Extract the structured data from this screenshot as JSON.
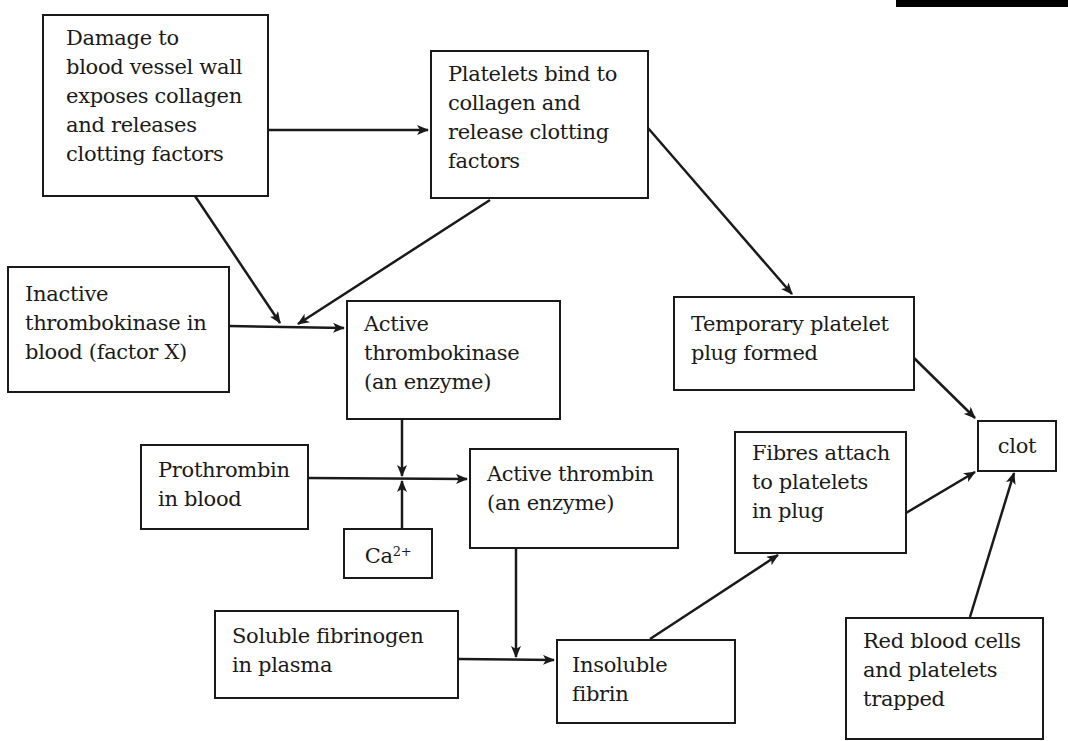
{
  "diagram": {
    "type": "flowchart",
    "topic": "Blood clotting cascade",
    "nodes": {
      "damage": {
        "lines": [
          "Damage to",
          "blood vessel wall",
          "exposes collagen",
          "and releases",
          "clotting factors"
        ]
      },
      "platelets_bind": {
        "lines": [
          "Platelets bind to",
          "collagen and",
          "release clotting",
          "factors"
        ]
      },
      "inactive_thrombokinase": {
        "lines": [
          "Inactive",
          "thrombokinase in",
          "blood (factor X)"
        ]
      },
      "active_thrombokinase": {
        "lines": [
          "Active",
          "thrombokinase",
          "(an enzyme)"
        ]
      },
      "temporary_plug": {
        "lines": [
          "Temporary platelet",
          "plug formed"
        ]
      },
      "clot": {
        "lines": [
          "clot"
        ]
      },
      "prothrombin": {
        "lines": [
          "Prothrombin",
          "in blood"
        ]
      },
      "calcium": {
        "base": "Ca",
        "superscript": "2+"
      },
      "active_thrombin": {
        "lines": [
          "Active thrombin",
          "(an enzyme)"
        ]
      },
      "fibres_attach": {
        "lines": [
          "Fibres attach",
          "to platelets",
          "in plug"
        ]
      },
      "soluble_fibrinogen": {
        "lines": [
          "Soluble fibrinogen",
          "in plasma"
        ]
      },
      "insoluble_fibrin": {
        "lines": [
          "Insoluble",
          "fibrin"
        ]
      },
      "red_blood_cells": {
        "lines": [
          "Red blood cells",
          "and platelets",
          "trapped"
        ]
      }
    },
    "edges": [
      {
        "from": "damage",
        "to": "platelets_bind"
      },
      {
        "from": "damage",
        "to": "active_thrombokinase",
        "via": "junction"
      },
      {
        "from": "platelets_bind",
        "to": "active_thrombokinase",
        "via": "junction"
      },
      {
        "from": "platelets_bind",
        "to": "temporary_plug"
      },
      {
        "from": "inactive_thrombokinase",
        "to": "active_thrombokinase"
      },
      {
        "from": "temporary_plug",
        "to": "clot"
      },
      {
        "from": "active_thrombokinase",
        "to": "active_thrombin",
        "via": "junction"
      },
      {
        "from": "prothrombin",
        "to": "active_thrombin"
      },
      {
        "from": "calcium",
        "to": "active_thrombin",
        "via": "junction"
      },
      {
        "from": "active_thrombin",
        "to": "insoluble_fibrin",
        "via": "junction"
      },
      {
        "from": "soluble_fibrinogen",
        "to": "insoluble_fibrin"
      },
      {
        "from": "insoluble_fibrin",
        "to": "fibres_attach"
      },
      {
        "from": "fibres_attach",
        "to": "clot"
      },
      {
        "from": "red_blood_cells",
        "to": "clot"
      }
    ],
    "colors": {
      "stroke": "#1a1a1a",
      "background": "#ffffff",
      "top_bar": "#000000"
    }
  }
}
